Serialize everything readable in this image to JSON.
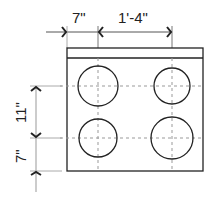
{
  "diagram": {
    "dimensions": {
      "left_offset": "7\"",
      "burner_spacing_horizontal": "1'-4\"",
      "burner_spacing_vertical": "11\"",
      "bottom_offset": "7\""
    },
    "burners": [
      {
        "position": "top-left"
      },
      {
        "position": "top-right"
      },
      {
        "position": "bottom-left"
      },
      {
        "position": "bottom-right"
      }
    ],
    "colors": {
      "line": "#222222",
      "centerline": "#999999",
      "background": "#ffffff"
    }
  }
}
